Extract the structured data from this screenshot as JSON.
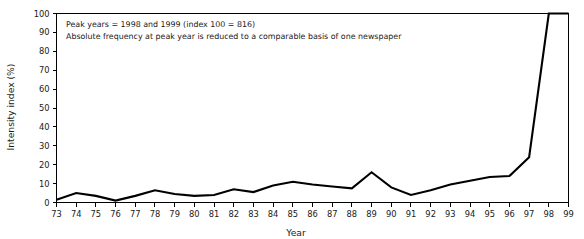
{
  "chart_data": {
    "type": "line",
    "title": "",
    "xlabel": "Year",
    "ylabel": "Intensity index (%)",
    "xlim": [
      73,
      99
    ],
    "ylim": [
      0,
      100
    ],
    "grid": false,
    "legend": null,
    "categories": [
      "73",
      "74",
      "75",
      "76",
      "77",
      "78",
      "79",
      "80",
      "81",
      "82",
      "83",
      "84",
      "85",
      "86",
      "87",
      "88",
      "89",
      "90",
      "91",
      "92",
      "93",
      "94",
      "95",
      "96",
      "97",
      "98",
      "99"
    ],
    "x": [
      73,
      74,
      75,
      76,
      77,
      78,
      79,
      80,
      81,
      82,
      83,
      84,
      85,
      86,
      87,
      88,
      89,
      90,
      91,
      92,
      93,
      94,
      95,
      96,
      97,
      98,
      99
    ],
    "values": [
      1.5,
      5.0,
      3.5,
      1.0,
      3.5,
      6.5,
      4.5,
      3.5,
      4.0,
      7.0,
      5.5,
      9.0,
      11.0,
      9.5,
      8.5,
      7.5,
      16.0,
      8.0,
      4.0,
      6.5,
      9.5,
      11.5,
      13.5,
      14.0,
      24.0,
      100.0,
      100.0
    ],
    "series": [
      {
        "name": "Intensity index",
        "values": [
          1.5,
          5.0,
          3.5,
          1.0,
          3.5,
          6.5,
          4.5,
          3.5,
          4.0,
          7.0,
          5.5,
          9.0,
          11.0,
          9.5,
          8.5,
          7.5,
          16.0,
          8.0,
          4.0,
          6.5,
          9.5,
          11.5,
          13.5,
          14.0,
          24.0,
          100.0,
          100.0
        ],
        "color": "#000000"
      }
    ],
    "y_ticks": [
      0,
      10,
      20,
      30,
      40,
      50,
      60,
      70,
      80,
      90,
      100
    ],
    "annotations": [
      "Peak years = 1998 and 1999 (index 100 = 816)",
      "Absolute frequency at peak year is reduced to a comparable basis of one newspaper"
    ]
  },
  "colors": {
    "line": "#000000",
    "axis": "#000000",
    "text": "#1a1a1a",
    "background": "#ffffff"
  }
}
